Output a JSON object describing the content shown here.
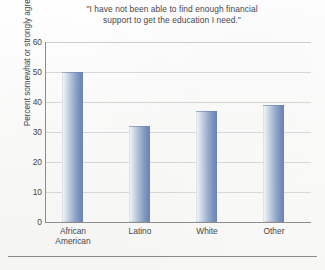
{
  "chart_data": {
    "type": "bar",
    "title": "\"I have not been able to find enough financial support to get the education I need.\"",
    "title_lines": [
      "\"I have not been able to find enough financial",
      "support to get the education I need.\""
    ],
    "xlabel": "",
    "ylabel": "Percent somewhat or strongly agree",
    "categories": [
      "African American",
      "Latino",
      "White",
      "Other"
    ],
    "category_lines": [
      [
        "African",
        "American"
      ],
      [
        "Latino"
      ],
      [
        "White"
      ],
      [
        "Other"
      ]
    ],
    "values": [
      50,
      32,
      37,
      39
    ],
    "ylim": [
      0,
      60
    ],
    "ytick_values": [
      60,
      50,
      40,
      30,
      20,
      10,
      0
    ],
    "ytick_labels": [
      "60",
      "50",
      "40",
      "30",
      "20",
      "10",
      "0"
    ],
    "grid": true,
    "grid_axis": "y",
    "legend": false,
    "bar_color": "#7690bd",
    "bar_color_light": "#fbfcfd",
    "grid_color": "#d9d9d9",
    "axis_color": "#8d8d8d",
    "background_color": "#fdfdfc"
  }
}
